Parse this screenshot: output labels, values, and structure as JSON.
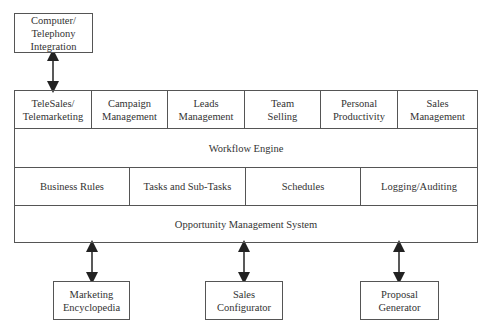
{
  "diagram": {
    "external_top": {
      "label": "Computer/\nTelephony\nIntegration"
    },
    "row_applications": [
      {
        "label": "TeleSales/\nTelemarketing"
      },
      {
        "label": "Campaign\nManagement"
      },
      {
        "label": "Leads\nManagement"
      },
      {
        "label": "Team\nSelling"
      },
      {
        "label": "Personal\nProductivity"
      },
      {
        "label": "Sales\nManagement"
      }
    ],
    "row_workflow": {
      "label": "Workflow Engine"
    },
    "row_services": [
      {
        "label": "Business Rules"
      },
      {
        "label": "Tasks and  Sub-Tasks"
      },
      {
        "label": "Schedules"
      },
      {
        "label": "Logging/Auditing"
      }
    ],
    "row_foundation": {
      "label": "Opportunity Management System"
    },
    "external_bottom": [
      {
        "label": "Marketing\nEncyclopedia"
      },
      {
        "label": "Sales\nConfigurator"
      },
      {
        "label": "Proposal\nGenerator"
      }
    ],
    "connectors": [
      {
        "from": "Computer/Telephony Integration",
        "to": "TeleSales/Telemarketing",
        "type": "bidirectional"
      },
      {
        "from": "Opportunity Management System",
        "to": "Marketing Encyclopedia",
        "type": "bidirectional"
      },
      {
        "from": "Opportunity Management System",
        "to": "Sales Configurator",
        "type": "bidirectional"
      },
      {
        "from": "Opportunity Management System",
        "to": "Proposal Generator",
        "type": "bidirectional"
      }
    ],
    "colors": {
      "line": "#555555",
      "text": "#333333",
      "background": "#ffffff"
    }
  }
}
